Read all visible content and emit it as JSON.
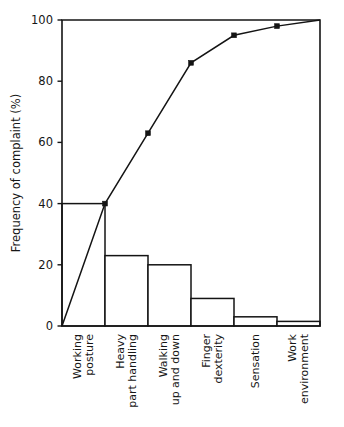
{
  "figure": {
    "faint_cropped_header": "· · ·",
    "background_color": "#ffffff",
    "ink_color": "#141414"
  },
  "chart_data": {
    "type": "bar",
    "title": "",
    "subtitle": "",
    "xlabel": "",
    "ylabel": "Frequency of complaint (%)",
    "categories": [
      "Working posture",
      "Heavy part handling",
      "Walking up and down",
      "Finger dexterity",
      "Sensation",
      "Work environment"
    ],
    "category_lines": [
      [
        "Working",
        "posture"
      ],
      [
        "Heavy",
        "part handling"
      ],
      [
        "Walking",
        "up and down"
      ],
      [
        "Finger",
        "dexterity"
      ],
      [
        "Sensation"
      ],
      [
        "Work",
        "environment"
      ]
    ],
    "values": [
      40,
      23,
      20,
      9,
      3,
      1.5
    ],
    "series": [
      {
        "name": "Frequency of complaint",
        "type": "bar",
        "values": [
          40,
          23,
          20,
          9,
          3,
          1.5
        ]
      },
      {
        "name": "Cumulative frequency",
        "type": "line",
        "values": [
          40,
          63,
          86,
          95,
          98,
          100
        ],
        "origin_value": 0,
        "markers": true
      }
    ],
    "ylim": [
      0,
      100
    ],
    "yticks": [
      0,
      20,
      40,
      60,
      80,
      100
    ],
    "ytick_labels": [
      "0",
      "20",
      "40",
      "60",
      "80",
      "100"
    ],
    "grid": false,
    "legend": "none",
    "legend_position": "none",
    "frame": "box"
  }
}
